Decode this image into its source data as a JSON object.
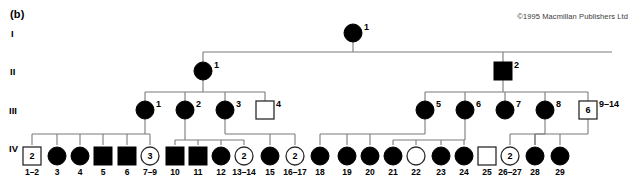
{
  "figure": {
    "panel_label": "(b)",
    "copyright": "©1995 Macmillan Publishers Ltd",
    "accent_fill": "#000000",
    "line_color": "#7a7a7a",
    "background": "#ffffff"
  },
  "generation_labels": {
    "g1": "I",
    "g2": "II",
    "g3": "III",
    "g4": "IV"
  },
  "chart_data": {
    "type": "diagram",
    "generations": [
      {
        "label": "I",
        "individuals": [
          {
            "id": "1",
            "shape": "circle",
            "fill": "filled",
            "count": null,
            "range": null
          }
        ]
      },
      {
        "label": "II",
        "individuals": [
          {
            "id": "1",
            "shape": "circle",
            "fill": "filled",
            "count": null,
            "range": null
          },
          {
            "id": "2",
            "shape": "square",
            "fill": "filled",
            "count": null,
            "range": null
          }
        ]
      },
      {
        "label": "III",
        "individuals": [
          {
            "id": "1",
            "shape": "circle",
            "fill": "filled",
            "count": null,
            "range": null
          },
          {
            "id": "2",
            "shape": "circle",
            "fill": "filled",
            "count": null,
            "range": null
          },
          {
            "id": "3",
            "shape": "circle",
            "fill": "filled",
            "count": null,
            "range": null
          },
          {
            "id": "4",
            "shape": "square",
            "fill": "open",
            "count": null,
            "range": null
          },
          {
            "id": "5",
            "shape": "circle",
            "fill": "filled",
            "count": null,
            "range": null
          },
          {
            "id": "6",
            "shape": "circle",
            "fill": "filled",
            "count": null,
            "range": null
          },
          {
            "id": "7",
            "shape": "circle",
            "fill": "filled",
            "count": null,
            "range": null
          },
          {
            "id": "8",
            "shape": "circle",
            "fill": "filled",
            "count": null,
            "range": null
          },
          {
            "id": "9–14",
            "shape": "square",
            "fill": "open",
            "count": "6",
            "range": "9–14"
          }
        ]
      },
      {
        "label": "IV",
        "individuals": [
          {
            "id": "1–2",
            "shape": "square",
            "fill": "open",
            "count": "2",
            "range": "1–2"
          },
          {
            "id": "3",
            "shape": "circle",
            "fill": "filled",
            "count": null,
            "range": "3"
          },
          {
            "id": "4",
            "shape": "circle",
            "fill": "filled",
            "count": null,
            "range": "4"
          },
          {
            "id": "5",
            "shape": "square",
            "fill": "filled",
            "count": null,
            "range": "5"
          },
          {
            "id": "6",
            "shape": "square",
            "fill": "filled",
            "count": null,
            "range": "6"
          },
          {
            "id": "7–9",
            "shape": "circle",
            "fill": "open",
            "count": "3",
            "range": "7–9"
          },
          {
            "id": "10",
            "shape": "square",
            "fill": "filled",
            "count": null,
            "range": "10"
          },
          {
            "id": "11",
            "shape": "square",
            "fill": "filled",
            "count": null,
            "range": "11"
          },
          {
            "id": "12",
            "shape": "circle",
            "fill": "filled",
            "count": null,
            "range": "12"
          },
          {
            "id": "13–14",
            "shape": "circle",
            "fill": "open",
            "count": "2",
            "range": "13–14"
          },
          {
            "id": "15",
            "shape": "circle",
            "fill": "filled",
            "count": null,
            "range": "15"
          },
          {
            "id": "16–17",
            "shape": "circle",
            "fill": "open",
            "count": "2",
            "range": "16–17"
          },
          {
            "id": "18",
            "shape": "circle",
            "fill": "filled",
            "count": null,
            "range": "18"
          },
          {
            "id": "19",
            "shape": "circle",
            "fill": "filled",
            "count": null,
            "range": "19"
          },
          {
            "id": "20",
            "shape": "circle",
            "fill": "filled",
            "count": null,
            "range": "20"
          },
          {
            "id": "21",
            "shape": "circle",
            "fill": "filled",
            "count": null,
            "range": "21"
          },
          {
            "id": "22",
            "shape": "circle",
            "fill": "open",
            "count": null,
            "range": "22"
          },
          {
            "id": "23",
            "shape": "circle",
            "fill": "filled",
            "count": null,
            "range": "23"
          },
          {
            "id": "24",
            "shape": "circle",
            "fill": "filled",
            "count": null,
            "range": "24"
          },
          {
            "id": "25",
            "shape": "square",
            "fill": "open",
            "count": null,
            "range": "25"
          },
          {
            "id": "26–27",
            "shape": "circle",
            "fill": "open",
            "count": "2",
            "range": "26–27"
          },
          {
            "id": "28",
            "shape": "circle",
            "fill": "filled",
            "count": null,
            "range": "28"
          },
          {
            "id": "29",
            "shape": "circle",
            "fill": "filled",
            "count": null,
            "range": "29"
          }
        ]
      }
    ]
  }
}
